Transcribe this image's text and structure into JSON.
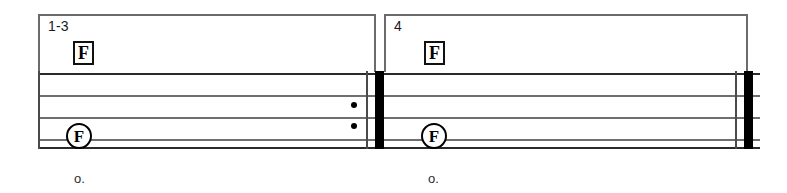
{
  "document": {
    "kind": "music-notation-excerpt",
    "width": 787,
    "height": 193,
    "background_color": "#ffffff",
    "ink_color": "#000000",
    "staff_line_color": "#6f6f6f"
  },
  "endings": [
    {
      "id": "ending-1-3",
      "label": "1-3",
      "x": 38,
      "y": 14,
      "width": 338,
      "height": 58
    },
    {
      "id": "ending-4",
      "label": "4",
      "x": 384,
      "y": 14,
      "width": 364,
      "height": 58
    }
  ],
  "chord_symbols": [
    {
      "id": "chord-box-1",
      "label": "F",
      "x": 73,
      "y": 41
    },
    {
      "id": "chord-box-2",
      "label": "F",
      "x": 424,
      "y": 41
    }
  ],
  "staff": {
    "top": 73,
    "bottom": 147,
    "left": 38,
    "right": 760,
    "line_count": 4,
    "line_y": [
      73,
      95,
      117,
      139
    ],
    "line_y_bottom_edge": 147,
    "line_color": "#6f6f6f"
  },
  "measures": [
    {
      "id": "measure-1",
      "ending": "1-3",
      "note": {
        "label": "F",
        "x": 66,
        "y": 123
      },
      "rhythm": "o."
    },
    {
      "id": "measure-2",
      "ending": "4",
      "note": {
        "label": "F",
        "x": 421,
        "y": 123
      },
      "rhythm": "o."
    }
  ],
  "barlines": [
    {
      "id": "barline-start",
      "type": "staff-left-edge",
      "x": 38,
      "top": 71,
      "height": 78,
      "thickness": 2
    },
    {
      "id": "barline-repeat-end",
      "type": "end-repeat",
      "thin_x": 366,
      "thick_x": 375,
      "top": 71,
      "height": 78,
      "dots": [
        {
          "x": 351,
          "y": 102
        },
        {
          "x": 351,
          "y": 123
        }
      ]
    },
    {
      "id": "barline-final",
      "type": "final",
      "thin_x": 735,
      "thick_x": 744,
      "top": 71,
      "height": 78
    }
  ],
  "rhythm_marks": [
    {
      "id": "rhythm-mark-1",
      "text": "o.",
      "x": 74,
      "y": 172
    },
    {
      "id": "rhythm-mark-2",
      "text": "o.",
      "x": 428,
      "y": 172
    }
  ],
  "circled_notes": [
    {
      "id": "circled-note-1",
      "label": "F",
      "x": 66,
      "y": 123
    },
    {
      "id": "circled-note-2",
      "label": "F",
      "x": 421,
      "y": 123
    }
  ]
}
